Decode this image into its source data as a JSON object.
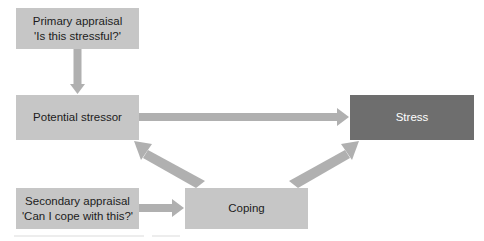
{
  "diagram": {
    "colors": {
      "node_light": "#c6c6c6",
      "node_dark": "#6e6e6e",
      "arrow": "#b0b0b0",
      "text_dark": "#1c1c1c",
      "text_light": "#ffffff",
      "background": "#ffffff"
    },
    "nodes": [
      {
        "id": "primary-appraisal",
        "line1": "Primary appraisal",
        "line2": "'Is this stressful?'",
        "style": "light"
      },
      {
        "id": "potential-stressor",
        "line1": "Potential stressor",
        "line2": "",
        "style": "light"
      },
      {
        "id": "stress",
        "line1": "Stress",
        "line2": "",
        "style": "dark"
      },
      {
        "id": "secondary-appraisal",
        "line1": "Secondary appraisal",
        "line2": "'Can I cope with this?'",
        "style": "light"
      },
      {
        "id": "coping",
        "line1": "Coping",
        "line2": "",
        "style": "light"
      }
    ],
    "arrows": [
      {
        "id": "primary-to-stressor",
        "from": "primary-appraisal",
        "to": "potential-stressor",
        "direction": "down"
      },
      {
        "id": "stressor-to-stress",
        "from": "potential-stressor",
        "to": "stress",
        "direction": "right"
      },
      {
        "id": "secondary-to-coping",
        "from": "secondary-appraisal",
        "to": "coping",
        "direction": "right"
      },
      {
        "id": "coping-to-stressor",
        "from": "coping",
        "to": "potential-stressor",
        "direction": "up-left"
      },
      {
        "id": "coping-to-stress",
        "from": "coping",
        "to": "stress",
        "direction": "up-right"
      }
    ]
  }
}
